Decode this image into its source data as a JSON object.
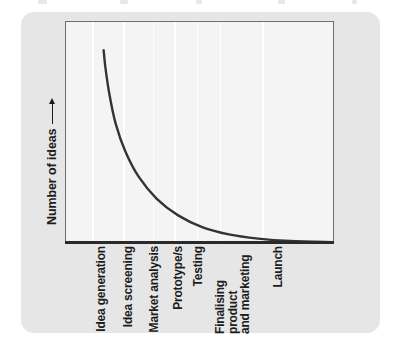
{
  "figure": {
    "background_color": "#e6e6e6",
    "plot_background_color": "#f4f4f4",
    "border_color": "#6e6e72",
    "axis_color": "#2a2a2a",
    "gridline_color": "#ffffff",
    "curve_color": "#333333"
  },
  "chart_data": {
    "type": "line",
    "title": "",
    "subtitle": "",
    "xlabel": "",
    "ylabel": "Number of ideas",
    "ylabel_arrow": "up-arrow",
    "grid": true,
    "grid_orientation": "vertical",
    "legend": "none",
    "axis_tick_values": false,
    "categories": [
      "Idea generation",
      "Idea screening",
      "Market analysis",
      "Prototype/s",
      "Testing",
      "Finalising product and marketing",
      "Launch"
    ],
    "category_label_lines": [
      [
        "Idea generation"
      ],
      [
        "Idea screening"
      ],
      [
        "Market analysis"
      ],
      [
        "Prototype/s"
      ],
      [
        "Testing"
      ],
      [
        "Finalising",
        "product",
        "and marketing"
      ],
      [
        "Launch"
      ]
    ],
    "x": [
      0,
      1,
      2,
      3,
      4,
      5,
      6
    ],
    "values": [
      100,
      34,
      14,
      7,
      4,
      2,
      1
    ],
    "ylim": [
      0,
      112
    ],
    "xlim": [
      -0.18,
      6.9
    ],
    "series": [
      {
        "name": "Number of ideas",
        "values": [
          100,
          34,
          14,
          7,
          4,
          2,
          1
        ]
      }
    ],
    "curve_shape": "exponential-decay",
    "annotations": []
  },
  "layout": {
    "gridline_x_fractions": [
      0.098,
      0.215,
      0.325,
      0.405,
      0.49,
      0.575,
      0.735
    ],
    "label_left_positions": [
      74,
      101,
      127,
      151,
      171,
      193,
      251
    ],
    "curve_points": [
      [
        0.141,
        0.128
      ],
      [
        0.148,
        0.21
      ],
      [
        0.163,
        0.33
      ],
      [
        0.186,
        0.46
      ],
      [
        0.222,
        0.585
      ],
      [
        0.272,
        0.7
      ],
      [
        0.34,
        0.8
      ],
      [
        0.42,
        0.875
      ],
      [
        0.51,
        0.928
      ],
      [
        0.61,
        0.961
      ],
      [
        0.72,
        0.98
      ],
      [
        0.84,
        0.991
      ],
      [
        1.0,
        0.996
      ]
    ]
  },
  "artifacts": {
    "top_marks_x": [
      38,
      120,
      196,
      278,
      352
    ],
    "top_marks_w": [
      9,
      8,
      6,
      7,
      5
    ]
  }
}
